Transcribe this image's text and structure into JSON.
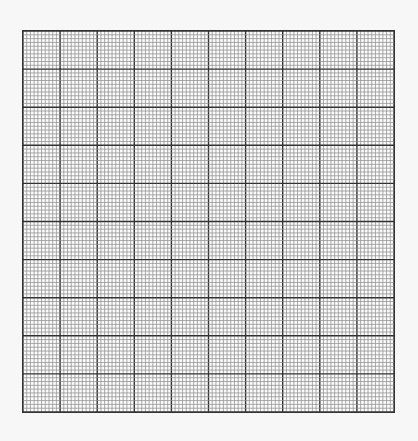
{
  "grid": {
    "major_columns": 10,
    "major_rows": 10,
    "minor_per_major": 10,
    "colors": {
      "background": "#f7f7f7",
      "paper": "#fafafa",
      "minor_line": "#8a8a8a",
      "major_line": "#333333"
    }
  }
}
